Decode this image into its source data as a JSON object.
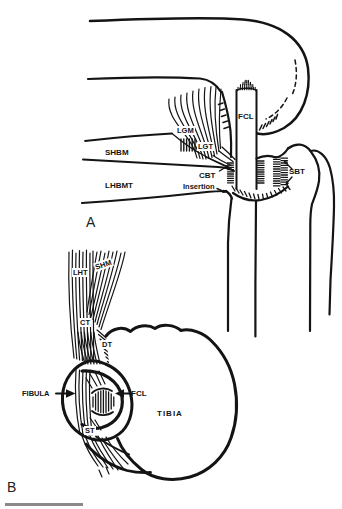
{
  "figure": {
    "panel_a": {
      "tag": "A",
      "labels": {
        "lgm": "LGM",
        "lgt": "LGT",
        "shbm": "SHBM",
        "lhbmt": "LHBMT",
        "fcl": "FCL",
        "cbt": "CBT",
        "insertion": "Insertion",
        "sbt": "SBT"
      }
    },
    "panel_b": {
      "tag": "B",
      "labels": {
        "lht": "LHT",
        "shm": "SHM",
        "ct": "CT",
        "dt": "DT",
        "fibula": "FIBULA",
        "fcl": "FCL",
        "st": "ST",
        "tibia": "TIBIA"
      }
    },
    "colors": {
      "ink": "#141414",
      "scale_bar": "#8a8a8a",
      "background": "#ffffff"
    }
  }
}
